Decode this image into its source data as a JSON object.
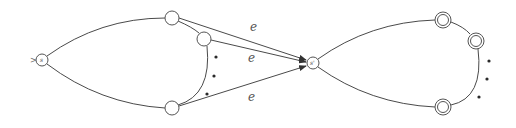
{
  "diagram": {
    "type": "automaton",
    "start_marker": ">",
    "states": [
      {
        "id": "s",
        "label": "s",
        "x": 42,
        "y": 60,
        "r": 6,
        "accepting": false,
        "start": true
      },
      {
        "id": "q1",
        "label": "",
        "x": 172,
        "y": 18,
        "r": 7,
        "accepting": false
      },
      {
        "id": "q2",
        "label": "",
        "x": 204,
        "y": 39,
        "r": 7,
        "accepting": false
      },
      {
        "id": "q3",
        "label": "",
        "x": 172,
        "y": 108,
        "r": 7,
        "accepting": false
      },
      {
        "id": "s_prime",
        "label": "s'",
        "x": 313,
        "y": 63,
        "r": 6,
        "accepting": false
      },
      {
        "id": "f1",
        "label": "",
        "x": 443,
        "y": 20,
        "r": 8,
        "accepting": true
      },
      {
        "id": "f2",
        "label": "",
        "x": 476,
        "y": 41,
        "r": 8,
        "accepting": true
      },
      {
        "id": "f3",
        "label": "",
        "x": 443,
        "y": 107,
        "r": 8,
        "accepting": true
      }
    ],
    "epsilon_label": "e",
    "edge_labels": [
      {
        "text": "e",
        "x": 254,
        "y": 31
      },
      {
        "text": "e",
        "x": 252,
        "y": 62
      },
      {
        "text": "e",
        "x": 252,
        "y": 101
      }
    ],
    "ellipsis_left": [
      [
        216,
        57
      ],
      [
        214,
        76
      ],
      [
        207,
        94
      ]
    ],
    "ellipsis_right": [
      [
        489,
        61
      ],
      [
        487,
        79
      ],
      [
        479,
        97
      ]
    ]
  }
}
